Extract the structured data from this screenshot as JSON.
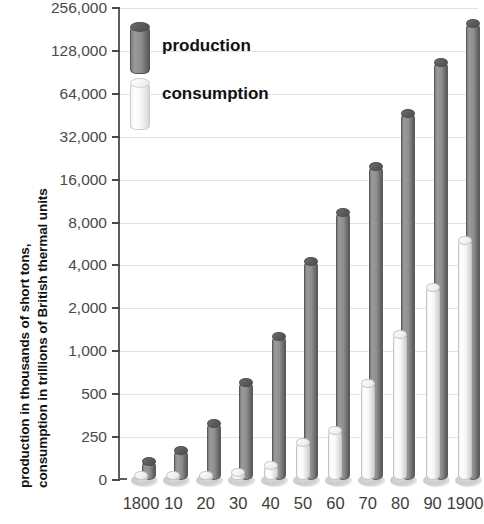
{
  "chart_data": {
    "type": "bar",
    "title": "",
    "xlabel": "",
    "ylabel": "production in thousands of short tons, consumption in trillions of British thermal units",
    "ylabel_line1": "production in thousands of short tons,",
    "ylabel_line2": "consumption in trillions of British thermal units",
    "yscale": "log",
    "grid": true,
    "legend_position": "top-left",
    "yticks": [
      0,
      250,
      500,
      1000,
      2000,
      4000,
      8000,
      16000,
      32000,
      64000,
      128000,
      256000
    ],
    "ytick_labels": [
      "0",
      "250",
      "500",
      "1,000",
      "2,000",
      "4,000",
      "8,000",
      "16,000",
      "32,000",
      "64,000",
      "128,000",
      "256,000"
    ],
    "ylim": [
      0,
      256000
    ],
    "categories": [
      "1800",
      "10",
      "20",
      "30",
      "40",
      "50",
      "60",
      "70",
      "80",
      "90",
      "1900"
    ],
    "series": [
      {
        "name": "production",
        "color": "#7f7f7f",
        "values": [
          108,
          177,
          331,
          646,
          1345,
          4429,
          10000,
          21000,
          50000,
          111000,
          212000
        ]
      },
      {
        "name": "consumption",
        "color": "#f2f2f2",
        "values": [
          10,
          16,
          27,
          47,
          90,
          219,
          290,
          630,
          1400,
          3000,
          6400
        ]
      }
    ]
  },
  "legend": {
    "items": [
      {
        "label": "production",
        "swatch": "dark-gray-3d-bar"
      },
      {
        "label": "consumption",
        "swatch": "light-gray-3d-bar"
      }
    ]
  }
}
